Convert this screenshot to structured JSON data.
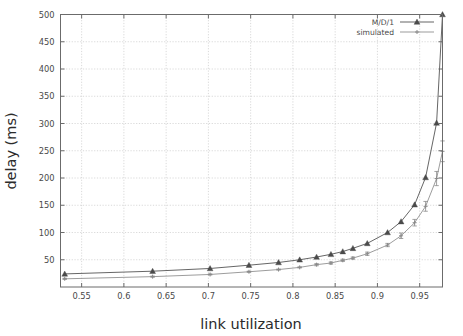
{
  "chart_data": {
    "type": "line",
    "title": "",
    "xlabel": "link utilization",
    "ylabel": "delay (ms)",
    "xlim": [
      0.525,
      0.977
    ],
    "ylim": [
      0,
      500
    ],
    "xticks": [
      0.55,
      0.6,
      0.65,
      0.7,
      0.75,
      0.8,
      0.85,
      0.9,
      0.95
    ],
    "xtick_labels": [
      "0.55",
      "0.6",
      "0.65",
      "0.7",
      "0.75",
      "0.8",
      "0.85",
      "0.9",
      "0.95"
    ],
    "yticks": [
      50,
      100,
      150,
      200,
      250,
      300,
      350,
      400,
      450,
      500
    ],
    "ytick_labels": [
      "50",
      "100",
      "150",
      "200",
      "250",
      "300",
      "350",
      "400",
      "450",
      "500"
    ],
    "grid": true,
    "grid_style": "dotted",
    "legend_position": "top-right",
    "series": [
      {
        "name": "M/D/1",
        "marker": "filled-triangle",
        "color": "#4a4a4a",
        "has_errorbars": false,
        "points": [
          {
            "x": 0.53,
            "y": 24
          },
          {
            "x": 0.634,
            "y": 29
          },
          {
            "x": 0.702,
            "y": 34
          },
          {
            "x": 0.748,
            "y": 40
          },
          {
            "x": 0.783,
            "y": 45
          },
          {
            "x": 0.808,
            "y": 50
          },
          {
            "x": 0.828,
            "y": 55
          },
          {
            "x": 0.845,
            "y": 60
          },
          {
            "x": 0.859,
            "y": 65
          },
          {
            "x": 0.871,
            "y": 71
          },
          {
            "x": 0.888,
            "y": 80
          },
          {
            "x": 0.912,
            "y": 100
          },
          {
            "x": 0.928,
            "y": 120
          },
          {
            "x": 0.944,
            "y": 151
          },
          {
            "x": 0.957,
            "y": 201
          },
          {
            "x": 0.97,
            "y": 301
          },
          {
            "x": 0.977,
            "y": 500
          }
        ]
      },
      {
        "name": "simulated",
        "marker": "small-cross",
        "color": "#8a8a8a",
        "has_errorbars": true,
        "points": [
          {
            "x": 0.53,
            "y": 15,
            "err": 1
          },
          {
            "x": 0.634,
            "y": 19,
            "err": 1
          },
          {
            "x": 0.702,
            "y": 23,
            "err": 1
          },
          {
            "x": 0.748,
            "y": 28,
            "err": 1
          },
          {
            "x": 0.783,
            "y": 32,
            "err": 1
          },
          {
            "x": 0.808,
            "y": 36,
            "err": 1
          },
          {
            "x": 0.828,
            "y": 41,
            "err": 2
          },
          {
            "x": 0.845,
            "y": 44,
            "err": 2
          },
          {
            "x": 0.859,
            "y": 49,
            "err": 2
          },
          {
            "x": 0.871,
            "y": 53,
            "err": 2
          },
          {
            "x": 0.888,
            "y": 61,
            "err": 3
          },
          {
            "x": 0.912,
            "y": 77,
            "err": 3
          },
          {
            "x": 0.928,
            "y": 94,
            "err": 5
          },
          {
            "x": 0.944,
            "y": 118,
            "err": 6
          },
          {
            "x": 0.957,
            "y": 148,
            "err": 9
          },
          {
            "x": 0.97,
            "y": 199,
            "err": 13
          },
          {
            "x": 0.977,
            "y": 249,
            "err": 19
          }
        ]
      }
    ]
  },
  "legend": {
    "entries": [
      {
        "label": "M/D/1"
      },
      {
        "label": "simulated"
      }
    ]
  },
  "colors": {
    "frame": "#6b6b6b",
    "grid": "#cfcfcf",
    "series_1": "#4a4a4a",
    "series_2": "#9a9a9a",
    "background": "#ffffff"
  }
}
